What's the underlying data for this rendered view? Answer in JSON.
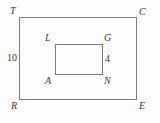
{
  "figure": {
    "background_color": "#fdfdfd",
    "stroke_color": "#7d7d7d",
    "text_color": "#3a3a3a",
    "outer_rectangle": {
      "name": "TCER",
      "vertices": {
        "top_left": "T",
        "top_right": "C",
        "bottom_right": "E",
        "bottom_left": "R"
      }
    },
    "inner_rectangle": {
      "name": "LGNA",
      "vertices": {
        "top_left": "L",
        "top_right": "G",
        "bottom_right": "N",
        "bottom_left": "A"
      }
    },
    "measurements": {
      "outer_left_side": "10",
      "inner_right_side": "4"
    }
  }
}
